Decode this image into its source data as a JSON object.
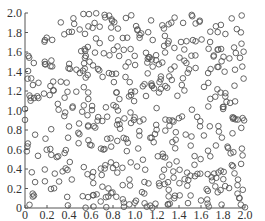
{
  "chart_data": {
    "type": "scatter",
    "title": "",
    "xlabel": "",
    "ylabel": "",
    "xlim": [
      0,
      2.0
    ],
    "ylim": [
      0,
      2.0
    ],
    "grid": false,
    "legend": null,
    "marker": "open-circle",
    "marker_color": "#555555",
    "x_ticks": [
      "0",
      "0.2",
      "0.4",
      "0.6",
      "0.8",
      "1.0",
      "1.2",
      "1.4",
      "1.6",
      "1.8",
      "2.0"
    ],
    "y_ticks": [
      "0",
      "0.2",
      "0.4",
      "0.6",
      "0.8",
      "1.0",
      "1.2",
      "1.4",
      "1.6",
      "1.8",
      "2.0"
    ],
    "n_points": 500,
    "distribution": "uniform random in [0,2] x [0,2]",
    "seed": 12345
  }
}
